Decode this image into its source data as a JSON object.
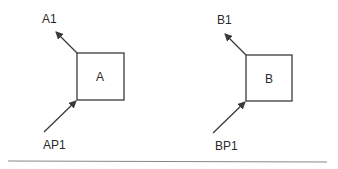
{
  "diagram": {
    "blocks": [
      {
        "id": "A",
        "label": "A",
        "output_label": "A1",
        "input_label": "AP1"
      },
      {
        "id": "B",
        "label": "B",
        "output_label": "B1",
        "input_label": "BP1"
      }
    ],
    "colors": {
      "stroke": "#3a3a3a",
      "text": "#2a2a2a",
      "separator": "#888888"
    }
  }
}
